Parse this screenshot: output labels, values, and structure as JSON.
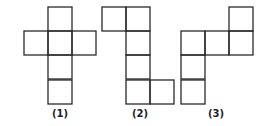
{
  "diagram": {
    "type": "cube-nets",
    "stroke_color": "#2a2a2a",
    "square_size": 24,
    "figures": [
      {
        "label": "(1)",
        "label_pos": [
          60,
          117
        ],
        "squares": [
          [
            48,
            7
          ],
          [
            24,
            31
          ],
          [
            48,
            31
          ],
          [
            72,
            31
          ],
          [
            48,
            55
          ],
          [
            48,
            80
          ]
        ]
      },
      {
        "label": "(2)",
        "label_pos": [
          140,
          117
        ],
        "squares": [
          [
            102,
            7
          ],
          [
            126,
            7
          ],
          [
            126,
            31
          ],
          [
            126,
            55
          ],
          [
            126,
            80
          ],
          [
            150,
            80
          ]
        ]
      },
      {
        "label": "(3)",
        "label_pos": [
          216,
          117
        ],
        "squares": [
          [
            229,
            7
          ],
          [
            181,
            31
          ],
          [
            205,
            31
          ],
          [
            229,
            31
          ],
          [
            181,
            55
          ],
          [
            181,
            80
          ]
        ]
      }
    ]
  }
}
